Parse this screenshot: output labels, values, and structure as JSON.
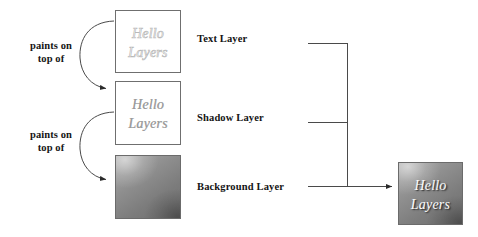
{
  "diagram": {
    "annotations": [
      {
        "line1": "paints on",
        "line2": "top of"
      },
      {
        "line1": "paints on",
        "line2": "top of"
      }
    ],
    "layers": [
      {
        "name": "Text Layer",
        "content_line1": "Hello",
        "content_line2": "Layers",
        "style": "outlined-light-gray-italic",
        "fill": "#ffffff",
        "border": "#6f6f6f"
      },
      {
        "name": "Shadow Layer",
        "content_line1": "Hello",
        "content_line2": "Layers",
        "style": "soft-gray-italic",
        "fill": "#ffffff",
        "border": "#6f6f6f"
      },
      {
        "name": "Background Layer",
        "content_line1": "",
        "content_line2": "",
        "style": "gray-gradient",
        "fill": "#8e8e8e",
        "border": "#6b6b6b"
      }
    ],
    "result": {
      "content_line1": "Hello",
      "content_line2": "Layers",
      "style": "white-italic-on-gray-gradient",
      "fill": "#8e8e8e",
      "text_color": "#fcfcfc"
    },
    "colors": {
      "line": "#4a4a4a",
      "text": "#141414",
      "box_border": "#6f6f6f",
      "gradient_light": "#a9a9a9",
      "gradient_dark": "#6e6e6e"
    }
  }
}
